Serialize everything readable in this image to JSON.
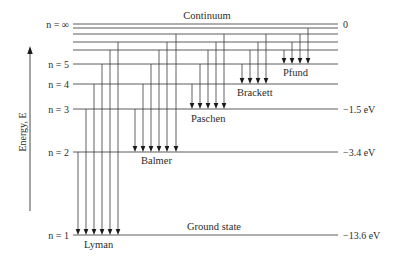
{
  "diagram": {
    "title_top": "Continuum",
    "title_bottom": "Ground state",
    "axis_label": "Energy, E",
    "levels": [
      {
        "id": "inf",
        "label": "n = ∞",
        "energy": "0"
      },
      {
        "id": "9",
        "label": "",
        "energy": ""
      },
      {
        "id": "8",
        "label": "",
        "energy": ""
      },
      {
        "id": "7",
        "label": "",
        "energy": ""
      },
      {
        "id": "6",
        "label": "",
        "energy": ""
      },
      {
        "id": "5",
        "label": "n = 5",
        "energy": ""
      },
      {
        "id": "4",
        "label": "n = 4",
        "energy": ""
      },
      {
        "id": "3",
        "label": "n = 3",
        "energy": "−1.5 eV"
      },
      {
        "id": "2",
        "label": "n = 2",
        "energy": "−3.4 eV"
      },
      {
        "id": "1",
        "label": "n = 1",
        "energy": "−13.6 eV"
      }
    ],
    "series": [
      {
        "name": "Lyman",
        "lower": "1",
        "uppers": [
          "2",
          "3",
          "4",
          "5",
          "6",
          "7"
        ]
      },
      {
        "name": "Balmer",
        "lower": "2",
        "uppers": [
          "3",
          "4",
          "5",
          "6",
          "7",
          "8"
        ]
      },
      {
        "name": "Paschen",
        "lower": "3",
        "uppers": [
          "4",
          "5",
          "6",
          "7",
          "8"
        ]
      },
      {
        "name": "Brackett",
        "lower": "4",
        "uppers": [
          "5",
          "6",
          "7",
          "8"
        ]
      },
      {
        "name": "Pfund",
        "lower": "5",
        "uppers": [
          "6",
          "7",
          "8",
          "9"
        ]
      }
    ]
  }
}
